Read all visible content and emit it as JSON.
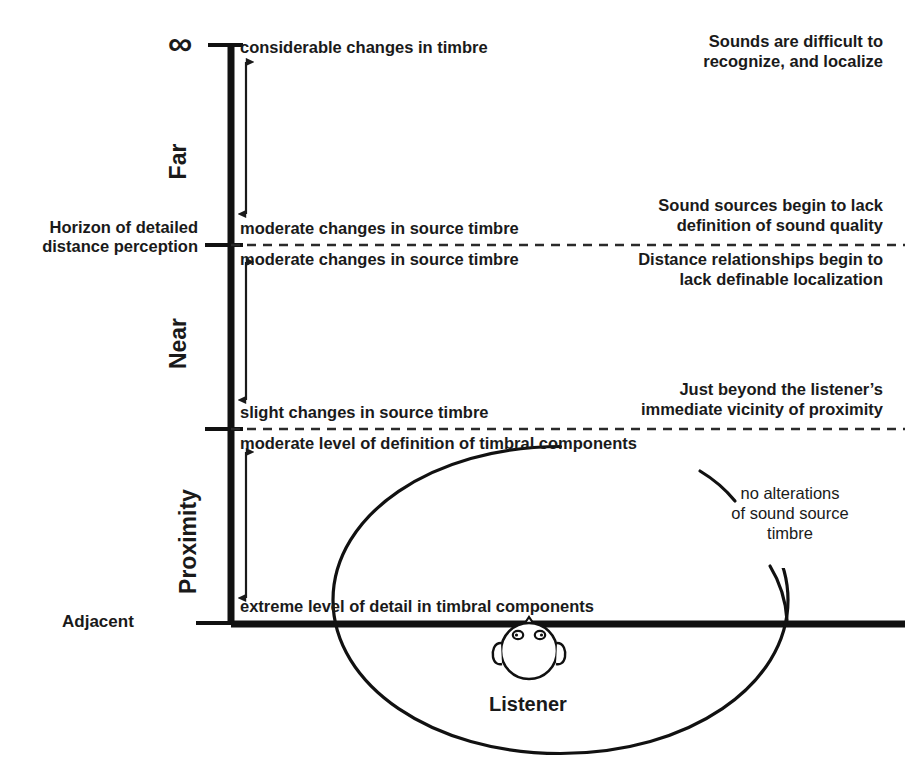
{
  "figure": {
    "axis": {
      "top_label": "∞",
      "bottom_label": "Adjacent",
      "horizon_note": "Horizon of detailed\ndistance perception",
      "categories": [
        {
          "label": "Far"
        },
        {
          "label": "Near"
        },
        {
          "label": "Proximity"
        }
      ]
    },
    "zones": [
      {
        "id": "far-upper",
        "inner_text": "considerable changes in timbre",
        "right_text": "Sounds are difficult to\nrecognize, and localize"
      },
      {
        "id": "far-lower",
        "inner_text": "moderate changes in source timbre",
        "right_text": "Sound sources begin to lack\ndefinition of sound quality"
      },
      {
        "id": "near-upper",
        "inner_text": "moderate changes in source timbre",
        "right_text": "Distance relationships begin to\nlack definable localization"
      },
      {
        "id": "near-lower",
        "inner_text": "slight changes in source timbre",
        "right_text": "Just beyond the listener’s\nimmediate vicinity of proximity"
      },
      {
        "id": "proximity-upper",
        "inner_text": "moderate level of definition of timbral components",
        "right_text": ""
      },
      {
        "id": "proximity-lower",
        "inner_text": "extreme level of detail in timbral components",
        "right_text": ""
      }
    ],
    "callout": {
      "text": "no alterations\nof sound source\ntimbre"
    },
    "listener": {
      "label": "Listener",
      "icon": "listener-head-icon"
    },
    "colors": {
      "ink": "#1a1a1a",
      "background": "#ffffff",
      "rule": "#000000"
    }
  }
}
